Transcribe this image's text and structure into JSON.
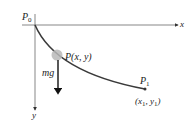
{
  "diagram": {
    "axes": {
      "x_label": "x",
      "y_label": "y",
      "origin_label": "P",
      "origin_sub": "0"
    },
    "point_moving": {
      "label": "P(x, y)"
    },
    "force": {
      "label": "mg"
    },
    "endpoint": {
      "label": "P",
      "label_sub": "1",
      "coords": "(x",
      "coords_sub1": "1",
      "coords_mid": ", y",
      "coords_sub2": "1",
      "coords_end": ")"
    },
    "colors": {
      "curve": "#3a3a3a",
      "axes": "#555555",
      "ball": "#b8b8b8",
      "text": "#222222"
    }
  }
}
